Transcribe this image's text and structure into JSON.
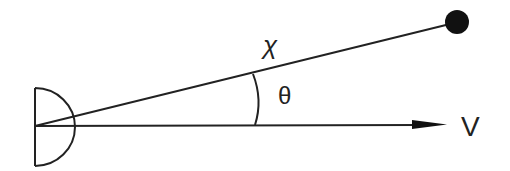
{
  "diagram": {
    "type": "geometry",
    "colors": {
      "stroke": "#222222",
      "background": "#ffffff",
      "dot": "#111111"
    },
    "observer": {
      "shape": "half-disc",
      "label": ""
    },
    "target": {
      "shape": "filled-circle"
    },
    "labels": {
      "distance": "χ",
      "angle": "θ",
      "velocity": "V"
    },
    "lines": [
      {
        "name": "line-of-sight",
        "from": "observer",
        "to": "target",
        "label": "χ"
      },
      {
        "name": "velocity-vector",
        "from": "observer",
        "direction": "right",
        "arrow": true,
        "label": "V"
      }
    ],
    "angle_arc": {
      "between": [
        "line-of-sight",
        "velocity-vector"
      ],
      "label": "θ"
    }
  }
}
